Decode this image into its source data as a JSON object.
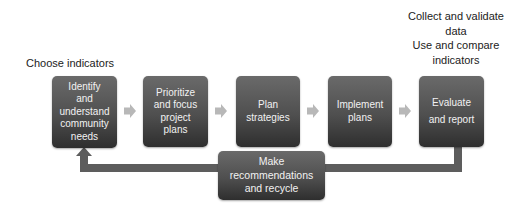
{
  "left_label": "Choose indicators",
  "top_right_note": {
    "line1": "Collect and validate",
    "line2": "data",
    "line3": "Use and compare",
    "line4": "indicators"
  },
  "steps": [
    {
      "line1": "Identify",
      "line2": "and",
      "line3": "understand",
      "line4": "community",
      "line5": "needs"
    },
    {
      "line1": "Prioritize",
      "line2": "and focus",
      "line3": "project",
      "line4": "plans"
    },
    {
      "line1": "Plan",
      "line2": "strategies"
    },
    {
      "line1": "Implement",
      "line2": "plans"
    },
    {
      "line1": "Evaluate",
      "line2": "and report"
    }
  ],
  "feedback": {
    "line1": "Make",
    "line2": "recommendations",
    "line3": "and recycle"
  },
  "colors": {
    "box_top": "#6a6a6a",
    "box_bottom": "#2e2e2e",
    "arrow": "#b8b8b8",
    "loop": "#5d5d5d",
    "text_light": "#f2f2f2"
  }
}
